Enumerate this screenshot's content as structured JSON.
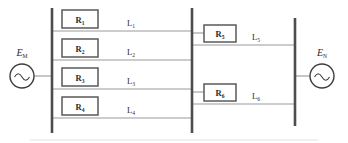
{
  "figure": {
    "type": "power-system-single-line-diagram",
    "title": "",
    "background_color": "#ffffff",
    "width": 348,
    "height": 143
  },
  "colors": {
    "bus": "#4d4d4d",
    "line": "#9a9a9a",
    "box_stroke": "#595959",
    "box_fill": "#ffffff",
    "source_stroke": "#3d3d3d",
    "text": "#2b2b2b"
  },
  "sources": [
    {
      "id": "source-m",
      "label_base": "E",
      "label_sub": "M",
      "symbol": "ac-source-icon",
      "side": "left",
      "cx": 22,
      "cy": 76,
      "r": 12,
      "label_x": 22,
      "label_y": 54
    },
    {
      "id": "source-n",
      "label_base": "E",
      "label_sub": "N",
      "symbol": "ac-source-icon",
      "side": "right",
      "cx": 322,
      "cy": 76,
      "r": 12,
      "label_x": 322,
      "label_y": 54
    }
  ],
  "buses": [
    {
      "id": "bus-m",
      "name": "bus-left",
      "x": 52,
      "y1": 8,
      "y2": 133
    },
    {
      "id": "bus-mid",
      "name": "bus-middle",
      "x": 192,
      "y1": 8,
      "y2": 133
    },
    {
      "id": "bus-n",
      "name": "bus-right",
      "x": 295,
      "y1": 18,
      "y2": 126
    }
  ],
  "source_leads": [
    {
      "id": "lead-m",
      "x1": 34,
      "y1": 76,
      "x2": 52,
      "y2": 76
    },
    {
      "id": "lead-n",
      "x1": 295,
      "y1": 76,
      "x2": 310,
      "y2": 76
    }
  ],
  "lines": [
    {
      "id": "line-1",
      "label": "L",
      "sub": "1",
      "from_bus": "bus-left",
      "to_bus": "bus-middle",
      "y": 31,
      "x1": 52,
      "x2": 192,
      "label_x": 131,
      "label_y": 25,
      "relay": {
        "id": "relay-1",
        "label": "R",
        "sub": "1",
        "x": 62,
        "y": 10,
        "w": 36,
        "h": 18
      }
    },
    {
      "id": "line-2",
      "label": "L",
      "sub": "2",
      "from_bus": "bus-left",
      "to_bus": "bus-middle",
      "y": 60,
      "x1": 52,
      "x2": 192,
      "label_x": 131,
      "label_y": 54,
      "relay": {
        "id": "relay-2",
        "label": "R",
        "sub": "2",
        "x": 62,
        "y": 39,
        "w": 36,
        "h": 18
      }
    },
    {
      "id": "line-3",
      "label": "L",
      "sub": "3",
      "from_bus": "bus-left",
      "to_bus": "bus-middle",
      "y": 89,
      "x1": 52,
      "x2": 192,
      "label_x": 131,
      "label_y": 83,
      "relay": {
        "id": "relay-3",
        "label": "R",
        "sub": "3",
        "x": 62,
        "y": 68,
        "w": 36,
        "h": 18
      }
    },
    {
      "id": "line-4",
      "label": "L",
      "sub": "4",
      "from_bus": "bus-left",
      "to_bus": "bus-middle",
      "y": 118,
      "x1": 52,
      "x2": 192,
      "label_x": 131,
      "label_y": 112,
      "relay": {
        "id": "relay-4",
        "label": "R",
        "sub": "4",
        "x": 62,
        "y": 97,
        "w": 36,
        "h": 18
      }
    },
    {
      "id": "line-5",
      "label": "L",
      "sub": "5",
      "from_bus": "bus-middle",
      "to_bus": "bus-right",
      "y": 45,
      "x1": 192,
      "x2": 295,
      "label_x": 254,
      "label_y": 39,
      "relay": {
        "id": "relay-5",
        "label": "R",
        "sub": "5",
        "x": 203,
        "y": 25,
        "w": 32,
        "h": 17
      }
    },
    {
      "id": "line-6",
      "label": "L",
      "sub": "6",
      "from_bus": "bus-middle",
      "to_bus": "bus-right",
      "y": 104,
      "x1": 192,
      "x2": 295,
      "label_x": 254,
      "label_y": 98,
      "relay": {
        "id": "relay-6",
        "label": "R",
        "sub": "6",
        "x": 203,
        "y": 84,
        "w": 32,
        "h": 17
      }
    }
  ],
  "relay_stubs": [
    {
      "id": "stub-relay-5",
      "x1": 192,
      "y1": 33,
      "x2": 203,
      "y2": 33
    },
    {
      "id": "stub-relay-6",
      "x1": 192,
      "y1": 92,
      "x2": 203,
      "y2": 92
    }
  ],
  "bottom_rule": {
    "x1": 30,
    "y1": 140,
    "x2": 318,
    "y2": 140
  }
}
